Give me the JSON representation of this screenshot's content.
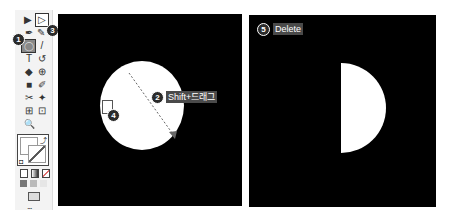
{
  "toolbar": {
    "tools": [
      {
        "name": "selection-tool",
        "glyph": "▶"
      },
      {
        "name": "direct-selection-tool",
        "glyph": "▷"
      },
      {
        "name": "pen-tool",
        "glyph": "✒"
      },
      {
        "name": "pencil-tool",
        "glyph": "✎"
      },
      {
        "name": "ellipse-tool",
        "glyph": "◯"
      },
      {
        "name": "brush-tool",
        "glyph": "/"
      },
      {
        "name": "type-tool",
        "glyph": "T"
      },
      {
        "name": "rotate-tool",
        "glyph": "↺"
      },
      {
        "name": "eraser-tool",
        "glyph": "◆"
      },
      {
        "name": "warp-tool",
        "glyph": "⊕"
      },
      {
        "name": "gradient-tool",
        "glyph": "■"
      },
      {
        "name": "eyedropper-tool",
        "glyph": "✐"
      },
      {
        "name": "blend-tool",
        "glyph": "✂"
      },
      {
        "name": "symbol-sprayer-tool",
        "glyph": "✦"
      },
      {
        "name": "artboard-tool",
        "glyph": "⊞"
      },
      {
        "name": "slice-tool",
        "glyph": "⊡"
      },
      {
        "name": "zoom-tool",
        "glyph": "🔍"
      }
    ],
    "more_label": "..."
  },
  "badges": {
    "b1": "1",
    "b2": "2",
    "b3": "3",
    "b4": "4",
    "b5": "5"
  },
  "canvas_left": {
    "instruction": "Shift+드래그"
  },
  "canvas_right": {
    "instruction": "Delete"
  }
}
